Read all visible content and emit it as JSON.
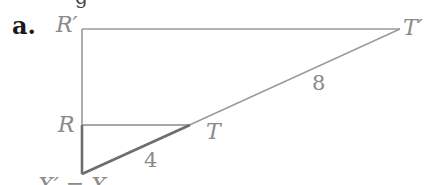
{
  "part_label": "a.",
  "top_fragment": "g",
  "points": {
    "R_prime": "R′",
    "T_prime": "T′",
    "R": "R",
    "T": "T",
    "X_prime_eq_X": "X′ = X"
  },
  "lengths": {
    "XT": "4",
    "TT_prime": "8"
  },
  "colors": {
    "line": "#9a9a9a",
    "bold_line": "#7a7a7a",
    "label": "#8a8a8a"
  }
}
